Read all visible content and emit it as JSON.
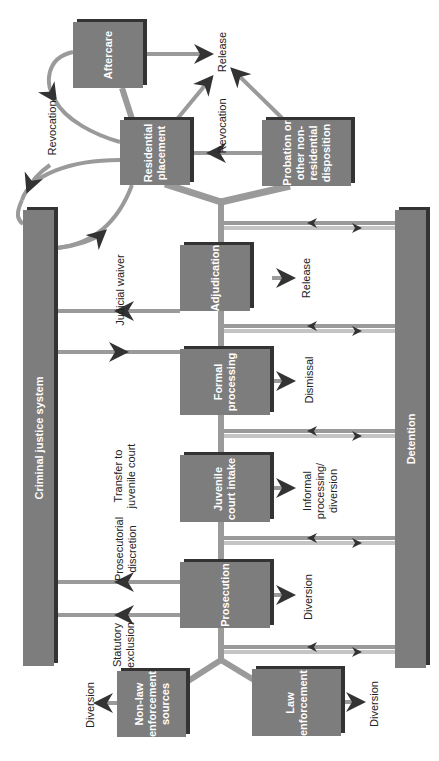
{
  "diagram": {
    "orientation": "rotated-90-ccw",
    "colors": {
      "box_fill": "#7d7d7d",
      "box_shadow": "#333333",
      "connector": "#9a9a9a",
      "connector_light": "#c4c4c4",
      "arrowhead": "#333333",
      "label_text": "#222222",
      "box_text": "#ffffff"
    },
    "bars": {
      "criminal_justice": "Criminal justice system",
      "detention": "Detention"
    },
    "nodes": {
      "aftercare": "Aftercare",
      "residential": "Residential\nplacement",
      "probation": "Probation or\nother non-\nresidential\ndisposition",
      "adjudication": "Adjudication",
      "formal": "Formal\nprocessing",
      "intake": "Juvenile\ncourt intake",
      "prosecution": "Prosecution",
      "non_law": "Non-law\nenforcement\nsources",
      "law": "Law\nenforcement"
    },
    "edge_labels": {
      "revocation_aftercare": "Revocation",
      "release_top": "Release",
      "revocation_probation": "Revocation",
      "judicial_waiver": "Judicial waiver",
      "release_adjudication": "Release",
      "dismissal": "Dismissal",
      "transfer": "Transfer to\njuvenile court",
      "informal": "Informal\nprocessing/\ndiversion",
      "prosecutorial": "Prosecutorial\ndiscretion",
      "diversion_prosecution": "Diversion",
      "statutory": "Statutory\nexclusion",
      "diversion_nonlaw": "Diversion",
      "diversion_law": "Diversion"
    }
  }
}
